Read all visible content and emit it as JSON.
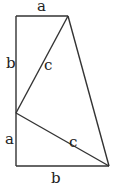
{
  "diagram": {
    "colors": {
      "stroke": "#333333",
      "text": "#222222",
      "background": "#ffffff"
    },
    "points": {
      "top_left": [
        16,
        16
      ],
      "top_right": [
        68,
        16
      ],
      "mid_left": [
        16,
        113
      ],
      "bottom_left": [
        16,
        166
      ],
      "bottom_right": [
        109,
        166
      ]
    },
    "labels": {
      "top_a": {
        "text": "a",
        "x": 37,
        "y": 11
      },
      "left_b": {
        "text": "b",
        "x": 6,
        "y": 68
      },
      "upper_c": {
        "text": "c",
        "x": 44,
        "y": 70
      },
      "lower_a": {
        "text": "a",
        "x": 5,
        "y": 144
      },
      "lower_c": {
        "text": "c",
        "x": 69,
        "y": 147
      },
      "bottom_b": {
        "text": "b",
        "x": 51,
        "y": 183
      }
    }
  }
}
